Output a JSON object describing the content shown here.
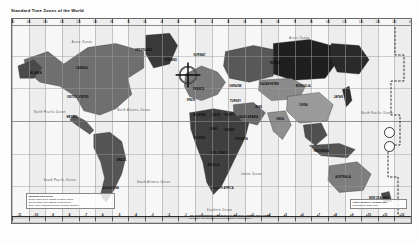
{
  "document": {
    "title": "Standard Time Zones of the World",
    "type": "reference-map",
    "projection": "Miller cylindrical"
  },
  "map": {
    "frame": {
      "x": 11,
      "y": 18,
      "width": 399,
      "height": 204
    },
    "background_color": "#fbfbfb",
    "border_color": "#6a6a6a",
    "grid_color": "#9a9a9a"
  },
  "zone_offsets": [
    "-11",
    "-10",
    "-9",
    "-8",
    "-7",
    "-6",
    "-5",
    "-4",
    "-3",
    "-2",
    "-1",
    "0",
    "+1",
    "+2",
    "+3",
    "+4",
    "+5",
    "+6",
    "+7",
    "+8",
    "+9",
    "+10",
    "+11",
    "+12"
  ],
  "longitude_ticks": [
    "180",
    "165",
    "150",
    "135",
    "120",
    "105",
    "90",
    "75",
    "60",
    "45",
    "30",
    "15",
    "0",
    "15",
    "30",
    "45",
    "60",
    "75",
    "90",
    "105",
    "120",
    "135",
    "150",
    "165",
    "180"
  ],
  "labels": {
    "oceans": [
      {
        "text": "Arctic Ocean",
        "x": 0.175,
        "y": 0.115
      },
      {
        "text": "North Pacific Ocean",
        "x": 0.095,
        "y": 0.455
      },
      {
        "text": "North Atlantic Ocean",
        "x": 0.305,
        "y": 0.445
      },
      {
        "text": "South Pacific Ocean",
        "x": 0.12,
        "y": 0.79
      },
      {
        "text": "South Atlantic Ocean",
        "x": 0.355,
        "y": 0.8
      },
      {
        "text": "Indian Ocean",
        "x": 0.6,
        "y": 0.76
      },
      {
        "text": "Arctic Ocean",
        "x": 0.72,
        "y": 0.095
      },
      {
        "text": "North Pacific Ocean",
        "x": 0.915,
        "y": 0.46
      },
      {
        "text": "Southern Ocean",
        "x": 0.52,
        "y": 0.935
      }
    ],
    "countries": [
      {
        "text": "ALASKA",
        "x": 0.06,
        "y": 0.265
      },
      {
        "text": "CANADA",
        "x": 0.175,
        "y": 0.24
      },
      {
        "text": "GREENLAND",
        "x": 0.33,
        "y": 0.15
      },
      {
        "text": "UNITED STATES",
        "x": 0.165,
        "y": 0.38
      },
      {
        "text": "MEXICO",
        "x": 0.15,
        "y": 0.48
      },
      {
        "text": "BRAZIL",
        "x": 0.275,
        "y": 0.69
      },
      {
        "text": "ARGENTINA",
        "x": 0.248,
        "y": 0.83
      },
      {
        "text": "ICELAND",
        "x": 0.398,
        "y": 0.2
      },
      {
        "text": "NORWAY",
        "x": 0.47,
        "y": 0.175
      },
      {
        "text": "RUSSIA",
        "x": 0.66,
        "y": 0.215
      },
      {
        "text": "CHINA",
        "x": 0.73,
        "y": 0.42
      },
      {
        "text": "INDIA",
        "x": 0.672,
        "y": 0.49
      },
      {
        "text": "MONGOLIA",
        "x": 0.73,
        "y": 0.33
      },
      {
        "text": "KAZAKHSTAN",
        "x": 0.645,
        "y": 0.32
      },
      {
        "text": "ALGERIA",
        "x": 0.47,
        "y": 0.47
      },
      {
        "text": "LIBYA",
        "x": 0.512,
        "y": 0.47
      },
      {
        "text": "EGYPT",
        "x": 0.545,
        "y": 0.47
      },
      {
        "text": "SUDAN",
        "x": 0.545,
        "y": 0.545
      },
      {
        "text": "CHAD",
        "x": 0.505,
        "y": 0.54
      },
      {
        "text": "NIGERIA",
        "x": 0.47,
        "y": 0.585
      },
      {
        "text": "D.R. CONGO",
        "x": 0.52,
        "y": 0.655
      },
      {
        "text": "ANGOLA",
        "x": 0.505,
        "y": 0.715
      },
      {
        "text": "SOUTH AFRICA",
        "x": 0.53,
        "y": 0.83
      },
      {
        "text": "ETHIOPIA",
        "x": 0.575,
        "y": 0.59
      },
      {
        "text": "SAUDI ARABIA",
        "x": 0.592,
        "y": 0.48
      },
      {
        "text": "IRAN",
        "x": 0.618,
        "y": 0.43
      },
      {
        "text": "AUSTRALIA",
        "x": 0.83,
        "y": 0.775
      },
      {
        "text": "INDONESIA",
        "x": 0.775,
        "y": 0.645
      },
      {
        "text": "JAPAN",
        "x": 0.818,
        "y": 0.38
      },
      {
        "text": "NEW ZEALAND",
        "x": 0.92,
        "y": 0.875
      },
      {
        "text": "FRANCE",
        "x": 0.468,
        "y": 0.345
      },
      {
        "text": "SPAIN",
        "x": 0.448,
        "y": 0.395
      },
      {
        "text": "TURKEY",
        "x": 0.56,
        "y": 0.4
      },
      {
        "text": "UKRAINE",
        "x": 0.56,
        "y": 0.33
      }
    ]
  },
  "legend_left": {
    "lines": [
      "Standard time zones",
      "Zones using UTC offsets of whole hours",
      "Zones using UTC offsets of half hours",
      "Time zone boundaries follow political borders"
    ]
  },
  "legend_bottom": {
    "lines": [
      "The actual Standard Time observed may differ from the zone shown.",
      "Boundary representation is not necessarily authoritative."
    ]
  },
  "legend_right": {
    "lines": [
      "Hours ahead of / behind UTC",
      "International Date Line"
    ]
  },
  "crosshair": {
    "x": 188,
    "y": 75,
    "radius": 11,
    "color": "#101010",
    "label": "target-marker"
  },
  "date_line": {
    "label": "International Date Line"
  }
}
